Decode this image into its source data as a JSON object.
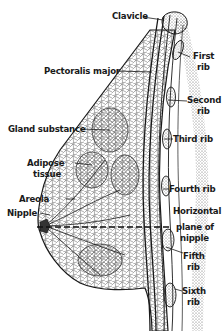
{
  "figure": {
    "colors": {
      "ink": "#1a1a1a",
      "background": "#ffffff",
      "shading": "#555555"
    },
    "labels": {
      "clavicle": "Clavicle",
      "first_rib_1": "First",
      "first_rib_2": "rib",
      "pectoralis_major": "Pectoralis major",
      "second_rib_1": "Second",
      "second_rib_2": "rib",
      "gland_substance": "Gland substance",
      "third_rib": "Third rib",
      "adipose_1": "Adipose",
      "adipose_2": "tissue",
      "fourth_rib": "Fourth rib",
      "areola": "Areola",
      "nipple": "Nipple",
      "horizontal_1": "Horizontal",
      "horizontal_2": "plane of",
      "horizontal_3": "nipple",
      "fifth_rib_1": "Fifth",
      "fifth_rib_2": "rib",
      "sixth_rib_1": "Sixth",
      "sixth_rib_2": "rib"
    }
  }
}
